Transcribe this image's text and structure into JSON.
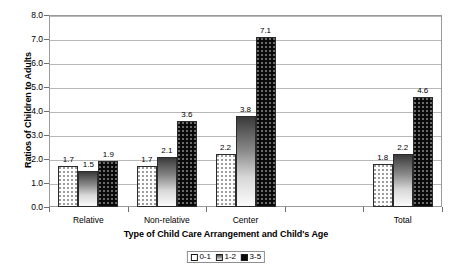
{
  "chart_data": {
    "type": "bar",
    "title": "",
    "xlabel": "Type of Child Care Arrangement and Child's Age",
    "ylabel": "Ratios of Children to Adults",
    "categories": [
      "Relative",
      "Non-relative",
      "Center",
      "",
      "Total"
    ],
    "ylim": [
      0.0,
      8.0
    ],
    "ytick_labels": [
      "0.0",
      "1.0",
      "2.0",
      "3.0",
      "4.0",
      "5.0",
      "6.0",
      "7.0",
      "8.0"
    ],
    "ytick_values": [
      0.0,
      1.0,
      2.0,
      3.0,
      4.0,
      5.0,
      6.0,
      7.0,
      8.0
    ],
    "grid": true,
    "legend_position": "bottom",
    "series": [
      {
        "name": "0-1",
        "values": [
          1.7,
          1.7,
          2.2,
          null,
          1.8
        ],
        "labels": [
          "1.7",
          "1.7",
          "2.2",
          "",
          "1.8"
        ],
        "fill": "light-dotted"
      },
      {
        "name": "1-2",
        "values": [
          1.5,
          2.1,
          3.8,
          null,
          2.2
        ],
        "labels": [
          "1.5",
          "2.1",
          "3.8",
          "",
          "2.2"
        ],
        "fill": "gray-gradient"
      },
      {
        "name": "3-5",
        "values": [
          1.9,
          3.6,
          7.1,
          null,
          4.6
        ],
        "labels": [
          "1.9",
          "3.6",
          "7.1",
          "",
          "4.6"
        ],
        "fill": "black-dotted"
      }
    ]
  },
  "legend": {
    "items": [
      {
        "label": "0-1"
      },
      {
        "label": "1-2"
      },
      {
        "label": "3-5"
      }
    ]
  },
  "colors": {
    "axis": "#9a9a9a",
    "grid": "#b8b8b8",
    "bar_series_0": "#fdfdfd",
    "bar_series_1": "#8a8a8a",
    "bar_series_2": "#0a0a0a",
    "text": "#000000"
  }
}
